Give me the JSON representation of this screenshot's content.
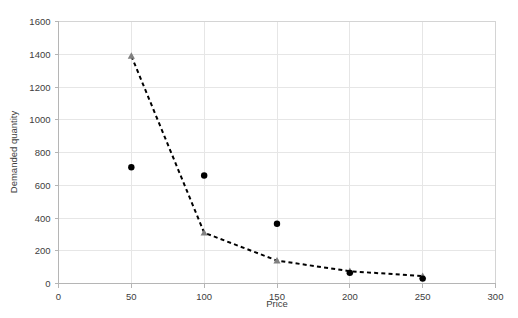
{
  "chart_data": {
    "type": "scatter",
    "title": "",
    "xlabel": "Price",
    "ylabel": "Demanded quantity",
    "xlim": [
      0,
      300
    ],
    "ylim": [
      0,
      1600
    ],
    "xticks": [
      0,
      50,
      100,
      150,
      200,
      250,
      300
    ],
    "yticks": [
      0,
      200,
      400,
      600,
      800,
      1000,
      1200,
      1400,
      1600
    ],
    "grid": true,
    "legend": "none",
    "series": [
      {
        "name": "Observed demand",
        "marker": "circle",
        "color": "#000000",
        "x": [
          50,
          100,
          150,
          200,
          250
        ],
        "values": [
          710,
          660,
          365,
          65,
          30
        ]
      },
      {
        "name": "Fitted demand curve",
        "marker": "triangle",
        "color": "#808080",
        "line": "dashed",
        "line_color": "#000000",
        "x": [
          50,
          100,
          150,
          200,
          250
        ],
        "values": [
          1390,
          310,
          140,
          75,
          45
        ]
      }
    ]
  },
  "axes": {
    "x_title": "Price",
    "y_title": "Demanded quantity",
    "x_tick_labels": [
      "0",
      "50",
      "100",
      "150",
      "200",
      "250",
      "300"
    ],
    "y_tick_labels": [
      "0",
      "200",
      "400",
      "600",
      "800",
      "1000",
      "1200",
      "1400",
      "1600"
    ]
  },
  "colors": {
    "scatter": "#000000",
    "trend_marker": "#808080",
    "trend_line": "#000000",
    "grid": "#e6e6e6",
    "axis": "#b5b5b5",
    "text": "#404040",
    "background": "#ffffff"
  }
}
